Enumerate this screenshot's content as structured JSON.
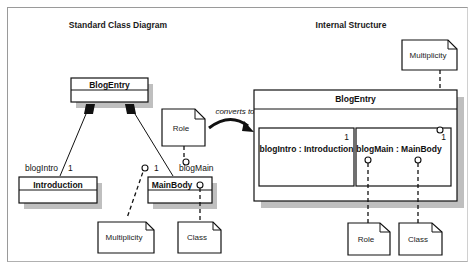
{
  "left_panel": {
    "title": "Standard Class Diagram",
    "classes": {
      "blog_entry": "BlogEntry",
      "introduction": "Introduction",
      "main_body": "MainBody"
    },
    "roles": {
      "intro_role": "blogIntro",
      "intro_multiplicity": "1",
      "main_role": "blogMain",
      "main_multiplicity": "1"
    },
    "notes": {
      "role": "Role",
      "multiplicity": "Multiplicity",
      "class": "Class"
    }
  },
  "transition": {
    "label": "converts to"
  },
  "right_panel": {
    "title": "Internal Structure",
    "composite": {
      "name": "BlogEntry",
      "parts": [
        {
          "role": "blogIntro",
          "type": "Introduction",
          "label": "blogIntro : Introduction",
          "multiplicity": "1"
        },
        {
          "role": "blogMain",
          "type": "MainBody",
          "label": "blogMain : MainBody",
          "multiplicity": "1"
        }
      ]
    },
    "notes": {
      "multiplicity": "Multiplicity",
      "role": "Role",
      "class": "Class"
    }
  }
}
